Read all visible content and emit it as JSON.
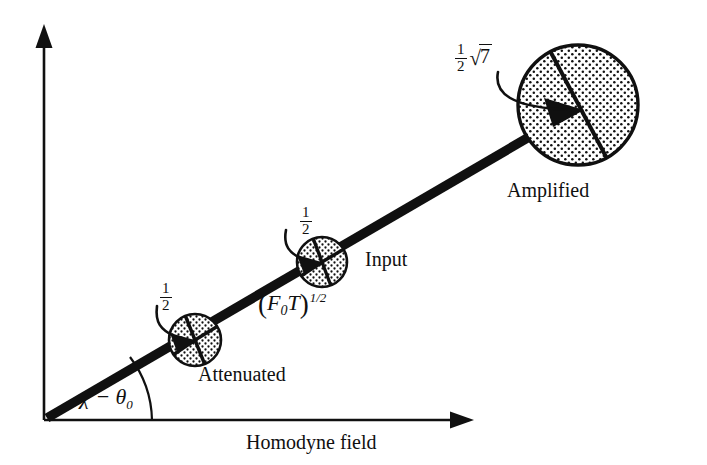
{
  "figure": {
    "background_color": "#ffffff",
    "ink_color": "#101010",
    "width": 707,
    "height": 465
  },
  "axes": {
    "x_label": "Homodyne field",
    "y_label": "",
    "origin": {
      "x": 44,
      "y": 420
    },
    "x_end": {
      "x": 472,
      "y": 420
    },
    "y_end": {
      "x": 44,
      "y": 27
    },
    "arrowheads": "both-ends-filled-triangles",
    "line_color": "#101010"
  },
  "ray": {
    "name": "signal-ray",
    "description": "Thick straight ray from origin through the three state circles",
    "start": {
      "x": 48,
      "y": 417
    },
    "end": {
      "x": 578,
      "y": 108
    },
    "stroke_width": 9,
    "color": "#101010",
    "angle_label": "χ − θ",
    "angle_label_subscript": "0",
    "angle_arc_radius": 74
  },
  "states": [
    {
      "id": "attenuated",
      "caption": "Attenuated",
      "uncertainty_label_numerator": "1",
      "uncertainty_label_denominator": "2",
      "center": {
        "x": 195,
        "y": 340
      },
      "radius": 27,
      "fill": "stippled",
      "fill_color": "#e8e8e8",
      "dot_color": "#101010",
      "has_internal_arrow": true,
      "divisions": 4
    },
    {
      "id": "input",
      "caption": "Input",
      "uncertainty_label_numerator": "1",
      "uncertainty_label_denominator": "2",
      "center": {
        "x": 322,
        "y": 262
      },
      "radius": 26,
      "fill": "stippled",
      "fill_color": "#e8e8e8",
      "dot_color": "#101010",
      "has_internal_arrow": true,
      "divisions": 4
    },
    {
      "id": "amplified",
      "caption": "Amplified",
      "uncertainty_label_numerator": "1",
      "uncertainty_label_denominator": "2",
      "uncertainty_label_radicand": "7",
      "uncertainty_label_radical": "√",
      "center": {
        "x": 578,
        "y": 105
      },
      "radius": 61,
      "fill": "stippled",
      "fill_color": "#e8e8e8",
      "dot_color": "#101010",
      "has_internal_arrow": true,
      "has_chord": true,
      "divisions": 2
    }
  ],
  "amplitude_label": {
    "open_paren": "(",
    "symbol_f": "F",
    "subscript_0": "0",
    "symbol_t": "T",
    "close_paren": ")",
    "exponent": "1/2"
  },
  "callout_lines": [
    {
      "from_label": "attenuated-half",
      "to_state": "attenuated",
      "style": "curved-hook"
    },
    {
      "from_label": "input-half",
      "to_state": "input",
      "style": "curved-hook"
    },
    {
      "from_label": "amplified-halfroot7",
      "to_state": "amplified",
      "style": "curved-hook"
    }
  ]
}
